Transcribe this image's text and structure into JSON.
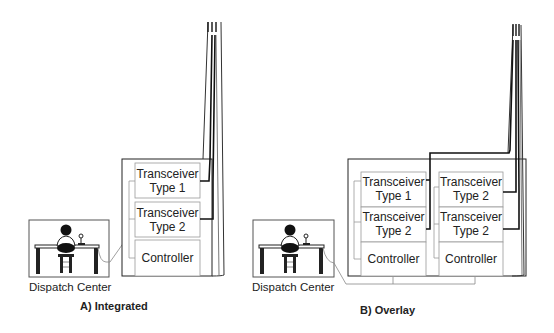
{
  "diagram": {
    "panels": [
      {
        "caption": "A) Integrated",
        "dispatch_label": "Dispatch Center",
        "modules": [
          {
            "line1": "Transceiver",
            "line2": "Type 1"
          },
          {
            "line1": "Transceiver",
            "line2": "Type 2"
          },
          {
            "line1": "Controller"
          }
        ]
      },
      {
        "caption": "B) Overlay",
        "dispatch_label": "Dispatch Center",
        "racks": [
          {
            "modules": [
              {
                "line1": "Transceiver",
                "line2": "Type 1"
              },
              {
                "line1": "Transceiver",
                "line2": "Type 2"
              },
              {
                "line1": "Controller"
              }
            ]
          },
          {
            "modules": [
              {
                "line1": "Transceiver",
                "line2": "Type 2"
              },
              {
                "line1": "Transceiver",
                "line2": "Type 2"
              },
              {
                "line1": "Controller"
              }
            ]
          }
        ]
      }
    ],
    "colors": {
      "line": "#222222",
      "thin_line": "#888888",
      "text": "#222222"
    }
  }
}
